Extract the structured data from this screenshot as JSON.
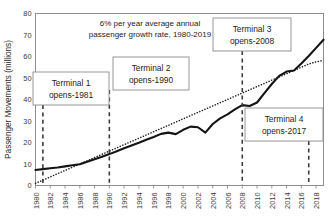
{
  "chart_data": {
    "type": "line",
    "title": "",
    "xlabel": "",
    "ylabel": "Passenger Movements (millions)",
    "xlim": [
      1980,
      2019
    ],
    "ylim": [
      0,
      80
    ],
    "ytick_step": 10,
    "yticks": [
      0,
      10,
      20,
      30,
      40,
      50,
      60,
      70,
      80
    ],
    "xticks": [
      1980,
      1982,
      1984,
      1986,
      1988,
      1990,
      1992,
      1994,
      1996,
      1998,
      2000,
      2002,
      2004,
      2006,
      2008,
      2010,
      2012,
      2014,
      2016,
      2018
    ],
    "grid": false,
    "legend": "none",
    "x": [
      1980,
      1981,
      1982,
      1983,
      1984,
      1985,
      1986,
      1987,
      1988,
      1989,
      1990,
      1991,
      1992,
      1993,
      1994,
      1995,
      1996,
      1997,
      1998,
      1999,
      2000,
      2001,
      2002,
      2003,
      2004,
      2005,
      2006,
      2007,
      2008,
      2009,
      2010,
      2011,
      2012,
      2013,
      2014,
      2015,
      2016,
      2017,
      2018,
      2019
    ],
    "series": [
      {
        "name": "Passenger movements",
        "style": "solid-thick",
        "color": "#141414",
        "values": [
          7.2,
          7.6,
          8.0,
          8.4,
          8.9,
          9.4,
          9.9,
          11.0,
          12.2,
          13.4,
          14.6,
          15.9,
          17.3,
          18.6,
          19.9,
          21.3,
          22.6,
          24.0,
          24.6,
          23.9,
          25.9,
          27.4,
          27.1,
          24.6,
          28.6,
          31.2,
          33.1,
          35.4,
          37.4,
          37.0,
          38.6,
          43.0,
          47.2,
          51.0,
          53.0,
          53.5,
          56.7,
          60.2,
          64.0,
          67.8
        ]
      },
      {
        "name": "6% per year average annual growth trend",
        "style": "dotted",
        "color": "#1a1a1a",
        "values": [
          1.0,
          2.5,
          4.0,
          5.5,
          7.0,
          8.5,
          10.0,
          11.5,
          13.0,
          14.5,
          16.0,
          17.5,
          19.0,
          20.5,
          22.0,
          23.5,
          25.0,
          26.5,
          28.0,
          29.5,
          31.0,
          32.5,
          34.0,
          35.5,
          37.0,
          38.5,
          40.0,
          41.5,
          43.0,
          44.5,
          46.0,
          47.5,
          49.0,
          50.5,
          52.0,
          53.5,
          55.0,
          56.5,
          57.5,
          58.2
        ]
      }
    ],
    "annotations": [
      {
        "name": "growth-rate-note",
        "line1": "6% per year average  annual",
        "line2": "passenger growth rate, 1980-2019"
      }
    ],
    "markers": [
      {
        "name": "terminal-1",
        "year": 1981,
        "line1": "Terminal 1",
        "line2": "opens-1981"
      },
      {
        "name": "terminal-2",
        "year": 1990,
        "line1": "Terminal 2",
        "line2": "opens-1990"
      },
      {
        "name": "terminal-3",
        "year": 2008,
        "line1": "Terminal 3",
        "line2": "opens-2008"
      },
      {
        "name": "terminal-4",
        "year": 2017,
        "line1": "Terminal 4",
        "line2": "opens-2017"
      }
    ],
    "colors": {
      "series": "#141414",
      "trend": "#1a1a1a",
      "marker": "#3c3c3c",
      "frame": "#8d8d8d",
      "text": "#1d1d1d",
      "background": "#ffffff"
    }
  }
}
